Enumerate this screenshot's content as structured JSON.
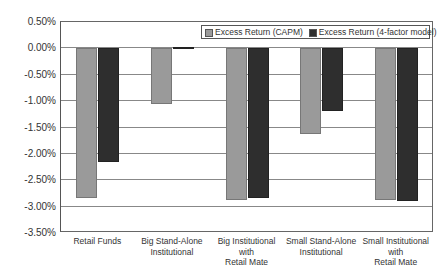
{
  "chart_data": {
    "type": "bar",
    "title": "",
    "xlabel": "",
    "ylabel": "",
    "ylim": [
      -3.5,
      0.5
    ],
    "yticks": [
      "0.50%",
      "0.00%",
      "-0.50%",
      "-1.00%",
      "-1.50%",
      "-2.00%",
      "-2.50%",
      "-3.00%",
      "-3.50%"
    ],
    "grid": true,
    "legend_position": "top-right",
    "categories": [
      "Retail Funds",
      "Big Stand-Alone Institutional",
      "Big Institutional with Retail Mate",
      "Small Stand-Alone Institutional",
      "Small Institutional with Retail Mate"
    ],
    "category_lines": [
      [
        "Retail Funds"
      ],
      [
        "Big Stand-Alone",
        "Institutional"
      ],
      [
        "Big Institutional",
        "with",
        "Retail Mate"
      ],
      [
        "Small Stand-Alone",
        "Institutional"
      ],
      [
        "Small Institutional",
        "with",
        "Retail Mate"
      ]
    ],
    "series": [
      {
        "name": "Excess Return (CAPM)",
        "color": "#9a9a9a",
        "values": [
          -2.83,
          -1.06,
          -2.88,
          -1.63,
          -2.88
        ]
      },
      {
        "name": "Excess Return (4-factor model)",
        "color": "#2e2e2e",
        "values": [
          -2.16,
          0.02,
          -2.83,
          -1.19,
          -2.9
        ]
      }
    ]
  }
}
